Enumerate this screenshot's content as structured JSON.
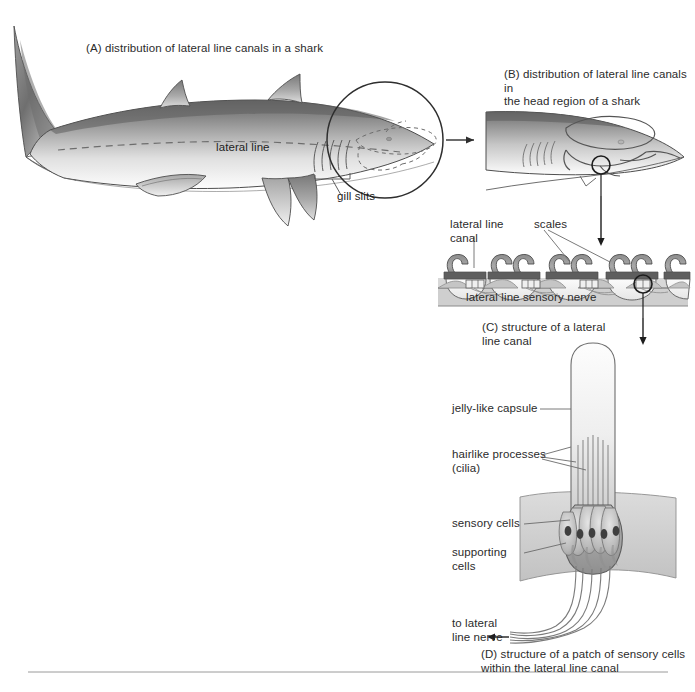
{
  "figure": {
    "title_a": "(A) distribution of lateral line canals in a shark",
    "title_b": "(B) distribution of lateral line canals in\n      the head region of a shark",
    "title_c": "(C) structure of a lateral\n      line canal",
    "title_d": "(D) structure of a patch of sensory cells\n      within the lateral line canal"
  },
  "panel_a": {
    "lateral_line_label": "lateral line",
    "gill_slits_label": "gill slits"
  },
  "panel_c": {
    "lateral_line_canal_label": "lateral line\ncanal",
    "scales_label": "scales",
    "sensory_nerve_label": "lateral line sensory nerve"
  },
  "panel_d": {
    "jelly_capsule_label": "jelly-like capsule",
    "hairlike_label": "hairlike processes\n(cilia)",
    "sensory_cells_label": "sensory cells",
    "supporting_cells_label": "supporting\ncells",
    "to_nerve_label": "to lateral\nline nerve"
  },
  "colors": {
    "ink": "#231f20",
    "outline": "#4a4a4a",
    "dorsal_dark": "#5b5b5b",
    "dorsal_mid": "#8e8e8e",
    "ventral_light": "#f4f4f4",
    "scale_gray": "#9c9c9c",
    "canal_dark": "#5a5a5a",
    "tissue_gray": "#c9c9c9",
    "nerve_band": "#cfcfcf",
    "leader": "#6b6b6b",
    "rule": "#9a9a9a"
  }
}
